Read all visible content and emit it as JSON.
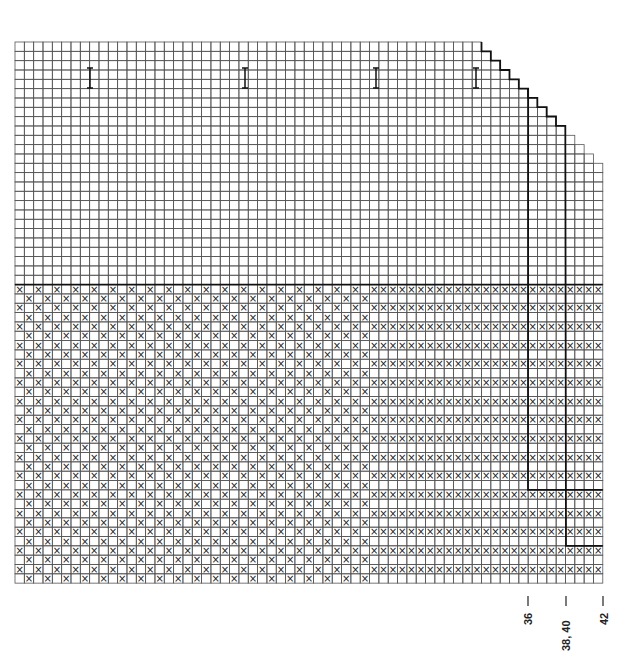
{
  "diagram": {
    "type": "knitting-chart",
    "grid": {
      "origin_x": 15,
      "origin_y": 42,
      "cell": 9.33,
      "cols": 63,
      "rows": 58,
      "line_color": "#555555",
      "bold_color": "#111111"
    },
    "divider_row": 26,
    "stepped_top": {
      "start_col": 50,
      "step_rows_per_col": 1
    },
    "markers": {
      "type": "I",
      "positions": [
        {
          "x": 90,
          "y": 78
        },
        {
          "x": 245,
          "y": 78
        },
        {
          "x": 376,
          "y": 78
        },
        {
          "x": 476,
          "y": 78
        }
      ]
    },
    "size_lines": [
      {
        "label": "36",
        "x": 528,
        "label_x": 522
      },
      {
        "label": "38, 40",
        "x": 566,
        "label_x": 560
      },
      {
        "label": "42",
        "x": 603,
        "label_x": 598
      }
    ],
    "pattern": {
      "symbol": "×",
      "checker_region_end_col": 38,
      "stripe_region_start_col": 38,
      "stripe_every_other_row": true
    }
  }
}
